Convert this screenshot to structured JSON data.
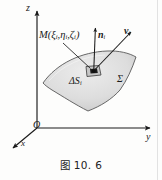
{
  "figure": {
    "caption": "图 10. 6",
    "background_color": "#fdfdfc",
    "line_color": "#1a1a1a",
    "surface_fill": "#dcdcdc",
    "surface_stroke": "#555555",
    "axes": {
      "z_label": "z",
      "y_label": "y",
      "x_label": "x",
      "origin_label": "O"
    },
    "annotations": {
      "point_label_main": "M",
      "point_label_open": "(",
      "point_label_xi": "ξ",
      "point_label_xi_sub": "i",
      "point_comma_1": ",",
      "point_label_eta": "η",
      "point_label_eta_sub": "i",
      "point_comma_2": ",",
      "point_label_zeta": "ζ",
      "point_label_zeta_sub": "i",
      "point_label_close": ")",
      "normal_vector": "n",
      "normal_vector_sub": "i",
      "velocity_vector": "v",
      "velocity_vector_sub": "i",
      "delta_s": "ΔS",
      "delta_s_sub": "i",
      "surface_label": "Σ"
    }
  }
}
